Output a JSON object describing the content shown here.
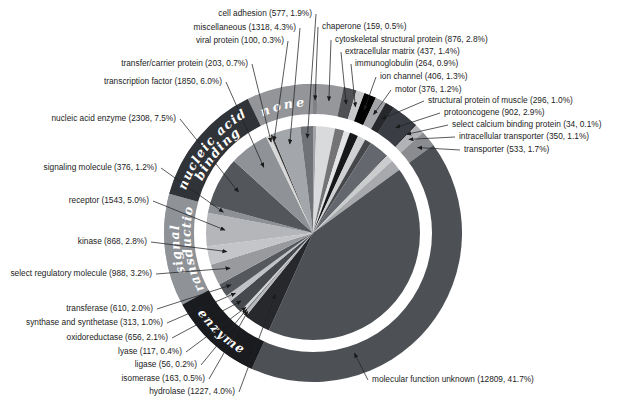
{
  "figure": {
    "background": "#ffffff"
  },
  "chart_data": {
    "type": "pie",
    "title": "",
    "label_format": "{name} ({count}, {pct}%)",
    "rotation": "clockwise-from-12",
    "legend_position": "none",
    "colors": {
      "background": "#ffffff",
      "separator_ring": "#ffffff",
      "leader_line": "#222326",
      "label_text": "#1c1c1c",
      "ring_text": "#ffffff"
    },
    "groups": [
      {
        "id": "none",
        "label_lines": [
          "none"
        ],
        "color": "#939598",
        "text_dir": "cw"
      },
      {
        "id": "nucleic-acid-binding",
        "label_lines": [
          "nucleic acid",
          "binding"
        ],
        "color": "#303439",
        "text_dir": "cw"
      },
      {
        "id": "signal-transduction",
        "label_lines": [
          "signal",
          "transduction"
        ],
        "color": "#8f9397",
        "text_dir": "cw"
      },
      {
        "id": "enzyme",
        "label_lines": [
          "enzyme"
        ],
        "color": "#1a1b1e",
        "text_dir": "ccw"
      }
    ],
    "slices": [
      {
        "id": "chaperone",
        "name": "chaperone",
        "count": 159,
        "pct": 0.5,
        "pct_label": "0.5",
        "group": null,
        "inner": "#a2a4a7",
        "ring": "#7f8184",
        "label": {
          "x": 322,
          "y": 29,
          "align": "start"
        },
        "arrow": {
          "r": 133
        }
      },
      {
        "id": "cytoskeletal-structural-protein",
        "name": "cytoskeletal structural protein",
        "count": 876,
        "pct": 2.8,
        "pct_label": "2.8",
        "group": null,
        "inner": "#d9dadb",
        "ring": "#95979a",
        "label": {
          "x": 335,
          "y": 42,
          "align": "start"
        },
        "arrow": {
          "r": 133
        }
      },
      {
        "id": "extracellular-matrix",
        "name": "extracellular matrix",
        "count": 437,
        "pct": 1.4,
        "pct_label": "1.4",
        "group": null,
        "inner": "#747477",
        "ring": "#4e5053",
        "label": {
          "x": 345,
          "y": 54,
          "align": "start"
        },
        "arrow": {
          "r": 133
        }
      },
      {
        "id": "immunoglobulin",
        "name": "immunoglobulin",
        "count": 264,
        "pct": 0.9,
        "pct_label": "0.9",
        "group": null,
        "inner": "#e3e4e5",
        "ring": "#c6c7c9",
        "label": {
          "x": 355,
          "y": 66,
          "align": "start"
        },
        "arrow": {
          "r": 133
        }
      },
      {
        "id": "ion-channel",
        "name": "ion channel",
        "count": 406,
        "pct": 1.3,
        "pct_label": "1.3",
        "group": null,
        "inner": "#17181a",
        "ring": "#020203",
        "label": {
          "x": 380,
          "y": 79,
          "align": "start"
        },
        "arrow": {
          "r": 133
        }
      },
      {
        "id": "motor",
        "name": "motor",
        "count": 376,
        "pct": 1.2,
        "pct_label": "1.2",
        "group": null,
        "inner": "#cfd0d2",
        "ring": "#a2a4a7",
        "label": {
          "x": 395,
          "y": 92,
          "align": "start"
        },
        "arrow": {
          "r": 133
        }
      },
      {
        "id": "structural-protein-of-muscle",
        "name": "structural protein of muscle",
        "count": 296,
        "pct": 1.0,
        "pct_label": "1.0",
        "group": null,
        "inner": "#45474b",
        "ring": "#26282c",
        "label": {
          "x": 428,
          "y": 103,
          "align": "start"
        },
        "arrow": {
          "r": 133
        }
      },
      {
        "id": "protooncogene",
        "name": "protooncogene",
        "count": 902,
        "pct": 2.9,
        "pct_label": "2.9",
        "group": null,
        "inner": "#64676d",
        "ring": "#3a3d43",
        "label": {
          "x": 444,
          "y": 115,
          "align": "start"
        },
        "arrow": {
          "r": 134
        }
      },
      {
        "id": "select-calcium-binding-protein",
        "name": "select calcium binding protein",
        "count": 34,
        "pct": 0.1,
        "pct_label": "0.1",
        "group": null,
        "inner": "#1e1f21",
        "ring": "#1e1f21",
        "label": {
          "x": 452,
          "y": 127,
          "align": "start"
        },
        "arrow": {
          "r": 136
        }
      },
      {
        "id": "intracellular-transporter",
        "name": "intracellular transporter",
        "count": 350,
        "pct": 1.1,
        "pct_label": "1.1",
        "group": null,
        "inner": "#cbccce",
        "ring": "#b1b3b6",
        "label": {
          "x": 459,
          "y": 139,
          "align": "start"
        },
        "arrow": {
          "r": 134
        }
      },
      {
        "id": "transporter",
        "name": "transporter",
        "count": 533,
        "pct": 1.7,
        "pct_label": "1.7",
        "group": null,
        "inner": "#a7a9ac",
        "ring": "#8a8c8f",
        "label": {
          "x": 464,
          "y": 152,
          "align": "start"
        },
        "arrow": {
          "r": 135
        }
      },
      {
        "id": "molecular-function-unknown",
        "name": "molecular function unknown",
        "count": 12809,
        "pct": 41.7,
        "pct_label": "41.7",
        "group": "self",
        "inner": "#4d5156",
        "ring": null,
        "label": {
          "x": 372,
          "y": 382,
          "align": "start"
        },
        "arrow": {
          "r": 127,
          "angle": 161
        }
      },
      {
        "id": "hydrolase",
        "name": "hydrolase",
        "count": 1227,
        "pct": 4.0,
        "pct_label": "4.0",
        "group": "enzyme",
        "inner": "#26282b",
        "ring": null,
        "label": {
          "x": 235,
          "y": 394,
          "align": "end"
        },
        "arrow": {
          "r": 72
        }
      },
      {
        "id": "isomerase",
        "name": "isomerase",
        "count": 163,
        "pct": 0.5,
        "pct_label": "0.5",
        "group": "enzyme",
        "inner": "#b5b7ba",
        "ring": null,
        "label": {
          "x": 205,
          "y": 381,
          "align": "end"
        },
        "arrow": {
          "r": 102
        }
      },
      {
        "id": "ligase",
        "name": "ligase",
        "count": 56,
        "pct": 0.2,
        "pct_label": "0.2",
        "group": "enzyme",
        "inner": "#6b6e72",
        "ring": null,
        "label": {
          "x": 197,
          "y": 367,
          "align": "end"
        },
        "arrow": {
          "r": 101
        }
      },
      {
        "id": "lyase",
        "name": "lyase",
        "count": 117,
        "pct": 0.4,
        "pct_label": "0.4",
        "group": "enzyme",
        "inner": "#d5d6d8",
        "ring": null,
        "label": {
          "x": 182,
          "y": 354,
          "align": "end"
        },
        "arrow": {
          "r": 100
        }
      },
      {
        "id": "oxidoreductase",
        "name": "oxidoreductase",
        "count": 656,
        "pct": 2.1,
        "pct_label": "2.1",
        "group": "enzyme",
        "inner": "#46494d",
        "ring": null,
        "label": {
          "x": 168,
          "y": 340,
          "align": "end"
        },
        "arrow": {
          "r": 99
        }
      },
      {
        "id": "synthase-and-synthetase",
        "name": "synthase and synthetase",
        "count": 313,
        "pct": 1.0,
        "pct_label": "1.0",
        "group": "enzyme",
        "inner": "#c0c2c5",
        "ring": null,
        "label": {
          "x": 163,
          "y": 325,
          "align": "end"
        },
        "arrow": {
          "r": 98
        }
      },
      {
        "id": "transferase",
        "name": "transferase",
        "count": 610,
        "pct": 2.0,
        "pct_label": "2.0",
        "group": "enzyme",
        "inner": "#55585c",
        "ring": null,
        "label": {
          "x": 153,
          "y": 311,
          "align": "end"
        },
        "arrow": {
          "r": 97
        }
      },
      {
        "id": "select-regulatory-molecule",
        "name": "select regulatory molecule",
        "count": 988,
        "pct": 3.2,
        "pct_label": "3.2",
        "group": "signal-transduction",
        "inner": "#989a9e",
        "ring": null,
        "label": {
          "x": 152,
          "y": 276,
          "align": "end"
        },
        "arrow": {
          "r": 90
        }
      },
      {
        "id": "kinase",
        "name": "kinase",
        "count": 868,
        "pct": 2.8,
        "pct_label": "2.8",
        "group": "signal-transduction",
        "inner": "#c3c5c8",
        "ring": null,
        "label": {
          "x": 147,
          "y": 244,
          "align": "end"
        },
        "arrow": {
          "r": 88
        }
      },
      {
        "id": "receptor",
        "name": "receptor",
        "count": 1543,
        "pct": 5.0,
        "pct_label": "5.0",
        "group": "signal-transduction",
        "inner": "#b4b6b9",
        "ring": null,
        "label": {
          "x": 149,
          "y": 203,
          "align": "end"
        },
        "arrow": {
          "r": 88
        }
      },
      {
        "id": "signaling-molecule",
        "name": "signaling molecule",
        "count": 376,
        "pct": 1.2,
        "pct_label": "1.2",
        "group": "signal-transduction",
        "inner": "#8d9094",
        "ring": null,
        "label": {
          "x": 157,
          "y": 170,
          "align": "end"
        },
        "arrow": {
          "r": 92
        }
      },
      {
        "id": "nucleic-acid-enzyme",
        "name": "nucleic acid enzyme",
        "count": 2308,
        "pct": 7.5,
        "pct_label": "7.5",
        "group": "nucleic-acid-binding",
        "inner": "#53565b",
        "ring": null,
        "label": {
          "x": 176,
          "y": 121,
          "align": "end"
        },
        "arrow": {
          "r": 85
        }
      },
      {
        "id": "transcription-factor",
        "name": "transcription factor",
        "count": 1850,
        "pct": 6.0,
        "pct_label": "6.0",
        "group": "nucleic-acid-binding",
        "inner": "#8f9297",
        "ring": null,
        "label": {
          "x": 222,
          "y": 84,
          "align": "end"
        },
        "arrow": {
          "r": 82
        }
      },
      {
        "id": "transfer-carrier-protein",
        "name": "transfer/carrier protein",
        "count": 203,
        "pct": 0.7,
        "pct_label": "0.7",
        "group": "none",
        "inner": "#d8d8d8",
        "ring": null,
        "label": {
          "x": 248,
          "y": 66,
          "align": "end"
        },
        "arrow": {
          "r": 100
        }
      },
      {
        "id": "viral-protein",
        "name": "viral protein",
        "count": 100,
        "pct": 0.3,
        "pct_label": "0.3",
        "group": "none",
        "inner": "#3a3a3a",
        "ring": null,
        "label": {
          "x": 284,
          "y": 43,
          "align": "end"
        },
        "arrow": {
          "r": 100
        }
      },
      {
        "id": "miscellaneous",
        "name": "miscellaneous",
        "count": 1318,
        "pct": 4.3,
        "pct_label": "4.3",
        "group": "none",
        "inner": "#a3a6aa",
        "ring": null,
        "label": {
          "x": 296,
          "y": 30,
          "align": "end"
        },
        "arrow": {
          "r": 92
        }
      },
      {
        "id": "cell-adhesion",
        "name": "cell adhesion",
        "count": 577,
        "pct": 1.9,
        "pct_label": "1.9",
        "group": "none",
        "inner": "#6f7276",
        "ring": null,
        "label": {
          "x": 312,
          "y": 16,
          "align": "end"
        },
        "arrow": {
          "r": 95
        }
      }
    ]
  }
}
